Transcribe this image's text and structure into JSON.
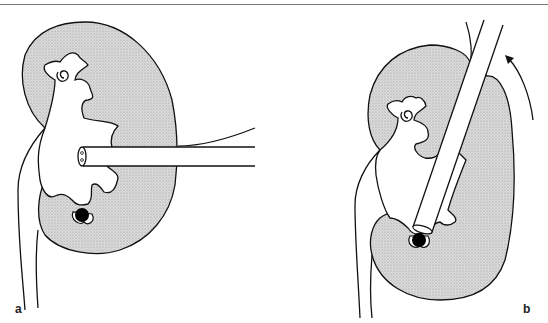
{
  "figure": {
    "panels": [
      {
        "label": "a",
        "description": "Kidney with nephroscope inserted horizontally into renal pelvis; stone in lower calyx"
      },
      {
        "label": "b",
        "description": "Kidney rotated with nephroscope angled downward reaching stone in lower calyx; curved arrow indicating rotation"
      }
    ]
  },
  "colors": {
    "stroke": "#111111",
    "parenchyma_fill": "#d4d4d4",
    "stone": "#000000",
    "background": "#ffffff"
  }
}
